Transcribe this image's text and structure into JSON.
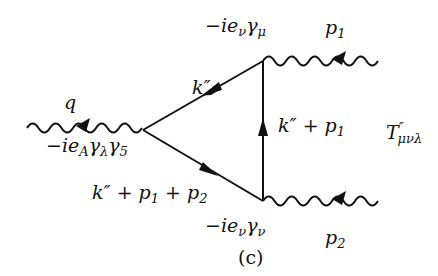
{
  "figure_caption": "(c)",
  "diagram": {
    "vertices": [
      {
        "id": "axial",
        "label": "−ie_Aγ_λγ_5"
      },
      {
        "id": "mu",
        "label": "−ie_vγ_μ"
      },
      {
        "id": "nu",
        "label": "−ie_vγ_ν"
      }
    ],
    "external_lines": [
      {
        "id": "q",
        "label": "q",
        "type": "wavy"
      },
      {
        "id": "p1",
        "label": "p1",
        "type": "wavy"
      },
      {
        "id": "p2",
        "label": "p2",
        "type": "wavy"
      }
    ],
    "internal_lines": [
      {
        "from": "mu",
        "to": "axial",
        "label": "k″"
      },
      {
        "from": "nu",
        "to": "mu",
        "label": "k″ + p1"
      },
      {
        "from": "axial",
        "to": "nu",
        "label": "k″ + p1 + p2"
      }
    ],
    "amplitude_label": "T″μνλ"
  },
  "labels": {
    "q": "q",
    "axial_vertex": {
      "pre": "−ie",
      "sub1": "A",
      "mid": "γ",
      "sub2": "λ",
      "mid2": "γ",
      "sub3": "5"
    },
    "mu_vertex": {
      "pre": "−ie",
      "sub1": "ν",
      "mid": "γ",
      "sub2": "μ"
    },
    "nu_vertex": {
      "pre": "−ie",
      "sub1": "ν",
      "mid": "γ",
      "sub2": "ν"
    },
    "p1": {
      "base": "p",
      "sub": "1"
    },
    "p2": {
      "base": "p",
      "sub": "2"
    },
    "k_top": "k″",
    "k_right": {
      "pre": "k″ + p",
      "sub": "1"
    },
    "k_bottom": {
      "pre": "k″ + p",
      "sub1": "1",
      "mid": " + p",
      "sub2": "2"
    },
    "T": {
      "base": "T",
      "sup": "″",
      "sub": "μνλ"
    },
    "caption": "(c)"
  }
}
